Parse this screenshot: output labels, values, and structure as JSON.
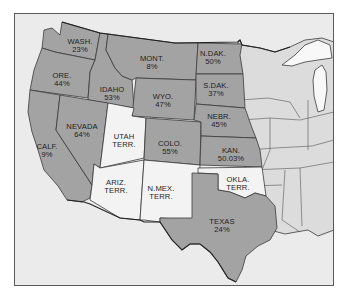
{
  "map": {
    "colors": {
      "background": "#ebebeb",
      "shaded_state": "#a3a3a3",
      "territory": "#f3f3f3",
      "other_state": "#dcdcdc",
      "lake": "#f8f8f8",
      "border": "#3a3a3a"
    },
    "regions": [
      {
        "id": "wash",
        "name": "WASH.",
        "value": "23%",
        "type": "state"
      },
      {
        "id": "ore",
        "name": "ORE.",
        "value": "44%",
        "type": "state"
      },
      {
        "id": "calf",
        "name": "CALF.",
        "value": "9%",
        "type": "state"
      },
      {
        "id": "idaho",
        "name": "IDAHO",
        "value": "53%",
        "type": "state"
      },
      {
        "id": "nevada",
        "name": "NEVADA",
        "value": "64%",
        "type": "state"
      },
      {
        "id": "mont",
        "name": "MONT.",
        "value": "8%",
        "type": "state"
      },
      {
        "id": "wyo",
        "name": "WYO.",
        "value": "47%",
        "type": "state"
      },
      {
        "id": "utah",
        "name": "UTAH",
        "value": "TERR.",
        "type": "territory"
      },
      {
        "id": "colo",
        "name": "COLO.",
        "value": "55%",
        "type": "state"
      },
      {
        "id": "ariz",
        "name": "ARIZ.",
        "value": "TERR.",
        "type": "territory"
      },
      {
        "id": "nmex",
        "name": "N.MEX.",
        "value": "TERR.",
        "type": "territory"
      },
      {
        "id": "ndak",
        "name": "N.DAK.",
        "value": "50%",
        "type": "state"
      },
      {
        "id": "sdak",
        "name": "S.DAK.",
        "value": "37%",
        "type": "state"
      },
      {
        "id": "nebr",
        "name": "NEBR.",
        "value": "45%",
        "type": "state"
      },
      {
        "id": "kan",
        "name": "KAN.",
        "value": "50.03%",
        "type": "state"
      },
      {
        "id": "okla",
        "name": "OKLA.",
        "value": "TERR.",
        "type": "territory"
      },
      {
        "id": "texas",
        "name": "TEXAS",
        "value": "24%",
        "type": "state"
      }
    ]
  }
}
